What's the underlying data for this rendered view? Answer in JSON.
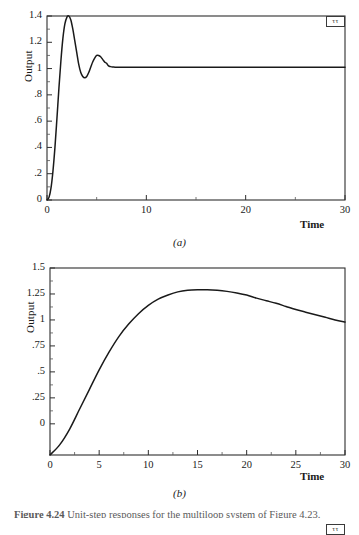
{
  "figure": {
    "caption_label": "Figure 4.24",
    "caption_text": "Unit-step responses for the multiloop system of Figure 4.23."
  },
  "panels": [
    {
      "id": "a",
      "subcaption": "(a)",
      "legend_mark": "ττ",
      "chart_data": {
        "type": "line",
        "title": "",
        "xlabel": "Time",
        "ylabel": "Output",
        "xlim": [
          0,
          30
        ],
        "ylim": [
          0,
          1.4
        ],
        "xticks": [
          0,
          10,
          20,
          30
        ],
        "xticklabels": [
          "0",
          "10",
          "20",
          "30"
        ],
        "yticks": [
          0,
          0.2,
          0.4,
          0.6,
          0.8,
          1,
          1.2,
          1.4
        ],
        "yticklabels": [
          "0",
          ".2",
          ".4",
          ".6",
          ".8",
          "1",
          "1.2",
          "1.4"
        ],
        "grid": false,
        "legend_position": "top-right",
        "annotations": [
          "Underdamped second-order step response; peak overshoot 1.40 at t=2.2; settles to 1.01"
        ],
        "series": [
          {
            "name": "output",
            "color": "#1a1a1a",
            "x": [
              0,
              0.2,
              0.4,
              0.6,
              0.8,
              1.0,
              1.2,
              1.4,
              1.6,
              1.8,
              2.0,
              2.2,
              2.4,
              2.6,
              2.8,
              3.0,
              3.2,
              3.4,
              3.6,
              3.8,
              4.0,
              4.2,
              4.4,
              4.6,
              4.8,
              5.0,
              5.2,
              5.4,
              5.6,
              5.8,
              6.0,
              6.2,
              6.4,
              6.6,
              6.8,
              7.0,
              7.5,
              8.0,
              9.0,
              10.0,
              12.0,
              15.0,
              20.0,
              25.0,
              30.0
            ],
            "y": [
              0.0,
              0.02,
              0.09,
              0.22,
              0.4,
              0.62,
              0.85,
              1.06,
              1.23,
              1.34,
              1.39,
              1.4,
              1.37,
              1.3,
              1.21,
              1.12,
              1.03,
              0.97,
              0.94,
              0.93,
              0.94,
              0.97,
              1.01,
              1.05,
              1.08,
              1.1,
              1.1,
              1.09,
              1.07,
              1.05,
              1.04,
              1.02,
              1.015,
              1.012,
              1.011,
              1.011,
              1.011,
              1.011,
              1.011,
              1.011,
              1.011,
              1.011,
              1.011,
              1.011,
              1.011
            ]
          }
        ]
      }
    },
    {
      "id": "b",
      "subcaption": "(b)",
      "legend_mark": "ττ",
      "chart_data": {
        "type": "line",
        "title": "",
        "xlabel": "Time",
        "ylabel": "Output",
        "xlim": [
          0,
          30
        ],
        "ylim": [
          -0.3,
          1.5
        ],
        "xticks": [
          0,
          5,
          10,
          15,
          20,
          25,
          30
        ],
        "xticklabels": [
          "0",
          "5",
          "10",
          "15",
          "20",
          "25",
          "30"
        ],
        "yticks": [
          0,
          0.25,
          0.5,
          0.75,
          1,
          1.25,
          1.5
        ],
        "yticklabels": [
          "0",
          ".25",
          ".5",
          ".75",
          "1",
          "1.25",
          "1.5"
        ],
        "grid": false,
        "legend_position": "top-right",
        "annotations": [
          "Slow overdamped-type rise; peak 1.29 at t=16 then gradual decay to 0.98 at t=30"
        ],
        "series": [
          {
            "name": "output",
            "color": "#1a1a1a",
            "x": [
              0,
              1,
              2,
              3,
              4,
              5,
              6,
              7,
              8,
              9,
              10,
              11,
              12,
              13,
              14,
              15,
              16,
              17,
              18,
              19,
              20,
              21,
              22,
              23,
              24,
              25,
              26,
              27,
              28,
              29,
              30
            ],
            "y": [
              -0.3,
              -0.2,
              -0.05,
              0.14,
              0.33,
              0.52,
              0.69,
              0.84,
              0.96,
              1.06,
              1.14,
              1.2,
              1.24,
              1.27,
              1.285,
              1.29,
              1.29,
              1.285,
              1.275,
              1.26,
              1.24,
              1.21,
              1.185,
              1.16,
              1.13,
              1.1,
              1.075,
              1.05,
              1.025,
              1.0,
              0.98
            ]
          }
        ]
      }
    }
  ]
}
